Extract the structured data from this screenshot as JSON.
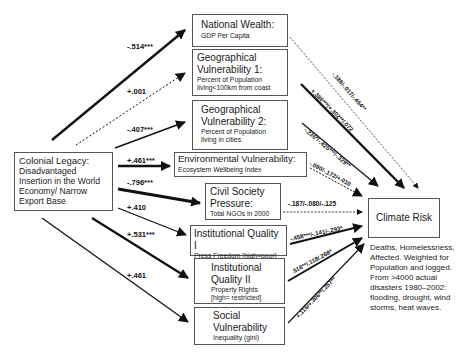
{
  "source_node": {
    "title": "Colonial Legacy:",
    "subtitle": "Disadvantaged Insertion in the World Economy/ Narrow Export Base"
  },
  "mediators": [
    {
      "id": "national-wealth",
      "title": "National Wealth:",
      "subtitle": "GDP Per Capita",
      "path_from_source": "-.514***",
      "path_to_outcome": "-.188/-.017/-.454**"
    },
    {
      "id": "geo-vuln-1",
      "title": "Geographical Vulnerability 1:",
      "subtitle": "Percent of Population living<100km from coast",
      "path_from_source": "+.001",
      "path_to_outcome": "+.386***/+.302**/.072"
    },
    {
      "id": "geo-vuln-2",
      "title": "Geographical Vulnerability 2:",
      "subtitle": "Percent of Population living in cities",
      "path_from_source": "-.407***",
      "path_to_outcome": "-.236*/-.425***/-.329**"
    },
    {
      "id": "env-vuln",
      "title": "Environmental Vulnerability:",
      "subtitle": "Ecosystem Wellbeing Index",
      "path_from_source": "+.461***",
      "path_to_outcome": "-.090/-.172/+.010"
    },
    {
      "id": "civil-society",
      "title": "Civil Society Pressure:",
      "subtitle": "Total NGOs in 2000",
      "path_from_source": "-.796***",
      "path_to_outcome": "-.187/-.080/-.125"
    },
    {
      "id": "inst-quality-1",
      "title": "Institutional Quality I",
      "subtitle": "Press Freedom [high=poor]",
      "path_from_source": "+.410",
      "path_to_outcome": "-.458***/-.141/-.293*"
    },
    {
      "id": "inst-quality-2",
      "title": "Institutional Quality II",
      "subtitle": "Property Rights [high= restricted]",
      "path_from_source": "+.531***",
      "path_to_outcome": ".516**/.118/.268*"
    },
    {
      "id": "social-vuln",
      "title": "Social Vulnerability",
      "subtitle": "Inequality (gini)",
      "path_from_source": "+.461",
      "path_to_outcome": "+.116/+.306**/.257**"
    }
  ],
  "outcome_node": {
    "title": "Climate Risk",
    "note": "Deaths, Homelessness, Affected. Weighted for Population and logged. From >4000 actual disasters 1980–2002: flooding, drought, wind storms, heat waves."
  }
}
